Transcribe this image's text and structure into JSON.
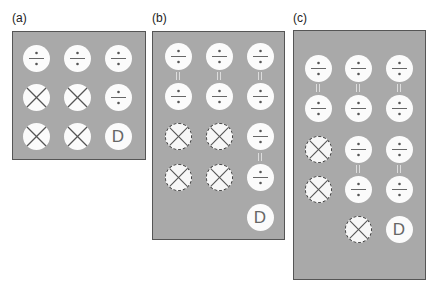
{
  "colors": {
    "panel_bg": "#a9a9a9",
    "token_bg": "#fbfbfb",
    "symbol": "#666666"
  },
  "panels": [
    {
      "label": "(a)",
      "rows": [
        [
          "divide",
          "divide",
          "divide"
        ],
        [
          "cross",
          "cross",
          "divide"
        ],
        [
          "cross",
          "cross",
          "D"
        ]
      ]
    },
    {
      "label": "(b)",
      "rows": [
        [
          "divide",
          "divide",
          "divide"
        ],
        [
          "divide",
          "divide",
          "divide"
        ],
        [
          "cross-dashed",
          "cross-dashed",
          "divide"
        ],
        [
          "cross-dashed",
          "cross-dashed",
          "divide"
        ],
        [
          "",
          "",
          "D"
        ]
      ],
      "equal_links": "columns 1-3 between rows 1-2; column 3 between rows 3-4"
    },
    {
      "label": "(c)",
      "rows": [
        [
          "divide",
          "divide",
          "divide"
        ],
        [
          "divide",
          "divide",
          "divide"
        ],
        [
          "cross-dashed",
          "divide",
          "divide"
        ],
        [
          "cross-dashed",
          "divide",
          "divide"
        ],
        [
          "",
          "cross-dashed",
          "D"
        ]
      ],
      "equal_links": "columns 1-3 between rows 1-2; columns 2-3 between rows 3-4"
    }
  ],
  "d_label": "D"
}
